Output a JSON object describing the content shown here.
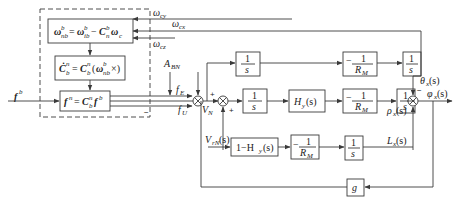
{
  "diagram": {
    "title": "",
    "inputs": {
      "f_b": "f",
      "f_b_sup": "b",
      "omega_cy": "ω",
      "omega_cy_sub": "cy",
      "omega_cx": "ω",
      "omega_cx_sub": "cx",
      "omega_cz": "ω",
      "omega_cz_sub": "cz",
      "A_BN": "A",
      "A_BN_sub": "BN",
      "V_rN": "V",
      "V_rN_sub": "rN",
      "V_rN_arg": "(s)"
    },
    "dashed_group": {
      "block1": "ω̂ = ω − C ω",
      "block2": "Ċ = C (ω ×)",
      "block3": "f = C f"
    },
    "signals": {
      "f_E": "f",
      "f_E_sub": "E",
      "f_U": "f",
      "f_U_sub": "U",
      "V_N": "V",
      "V_N_sub": "N",
      "theta": "θ",
      "theta_sub": "x",
      "theta_arg": "(s)",
      "phi": "φ",
      "phi_sub": "x",
      "phi_arg": "(s)",
      "rho": "ρ",
      "rho_sub": "x",
      "rho_arg": "(s)",
      "L": "L",
      "L_sub": "x",
      "L_arg": "(s)"
    },
    "blocks": {
      "integrator_top": {
        "num": "1",
        "den": "s"
      },
      "neg_RM_top": {
        "num": "1",
        "den": "R",
        "den_sub": "M",
        "sign": "−"
      },
      "integrator_top_right": {
        "num": "1",
        "den": "s"
      },
      "integrator_mid": {
        "num": "1",
        "den": "s"
      },
      "H_s": {
        "label": "H",
        "sub": "y",
        "arg": "(s)"
      },
      "neg_RM_mid": {
        "num": "1",
        "den": "R",
        "den_sub": "M",
        "sign": "−"
      },
      "integrator_mid_right": {
        "num": "1",
        "den": "s"
      },
      "one_minus_H": {
        "label": "1−H",
        "sub": "y",
        "arg": "(s)"
      },
      "neg_RM_bot": {
        "num": "1",
        "den": "R",
        "den_sub": "M",
        "sign": "−"
      },
      "integrator_bot": {
        "num": "1",
        "den": "s"
      },
      "gain_g": {
        "label": "g"
      }
    },
    "signs": {
      "sum1_plus": "+",
      "sum1_minus": "−",
      "sum2_plus_left": "+",
      "sum2_plus_bottom": "+",
      "sum3_minus": "−"
    }
  }
}
